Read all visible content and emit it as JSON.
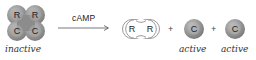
{
  "diagram": {
    "type": "reaction",
    "reactant": {
      "label": "inactive",
      "subunits": [
        "R",
        "R",
        "C",
        "C"
      ]
    },
    "arrow_label": "cAMP",
    "products": {
      "dimer": {
        "subunits": [
          "R",
          "R"
        ]
      },
      "plus_sign": "+",
      "catalytic_1": {
        "letter": "C",
        "label": "active"
      },
      "catalytic_2": {
        "letter": "C",
        "label": "active"
      }
    },
    "colors": {
      "subunit_fill": "#8f8f8f",
      "subunit_highlight": "#c8c8c8",
      "regulatory_outline": "#9a9a9a",
      "arrow": "#555555"
    }
  }
}
